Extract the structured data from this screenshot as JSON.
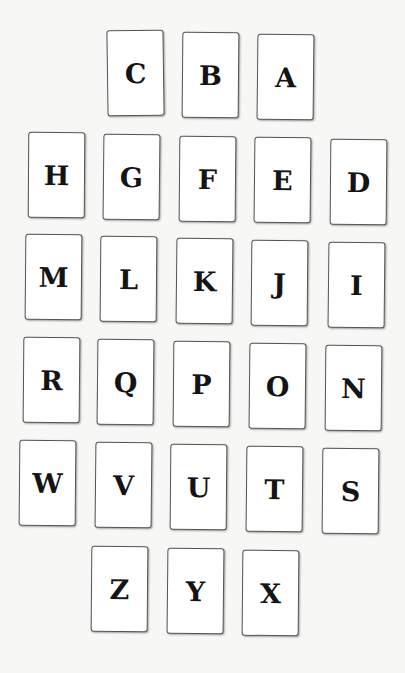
{
  "cards": [
    {
      "letter": "C",
      "x": 107,
      "y": 30,
      "rot": -0.8
    },
    {
      "letter": "B",
      "x": 182,
      "y": 32,
      "rot": 0.5
    },
    {
      "letter": "A",
      "x": 257,
      "y": 34,
      "rot": 0.6
    },
    {
      "letter": "H",
      "x": 28,
      "y": 132,
      "rot": 0.4
    },
    {
      "letter": "G",
      "x": 103,
      "y": 134,
      "rot": 0.6
    },
    {
      "letter": "F",
      "x": 179,
      "y": 136,
      "rot": 0.5
    },
    {
      "letter": "E",
      "x": 254,
      "y": 137,
      "rot": 0.6
    },
    {
      "letter": "D",
      "x": 330,
      "y": 139,
      "rot": 0.5
    },
    {
      "letter": "M",
      "x": 25,
      "y": 234,
      "rot": 0.5
    },
    {
      "letter": "L",
      "x": 100,
      "y": 236,
      "rot": 0.5
    },
    {
      "letter": "K",
      "x": 176,
      "y": 238,
      "rot": 0.6
    },
    {
      "letter": "J",
      "x": 251,
      "y": 240,
      "rot": 0.5
    },
    {
      "letter": "I",
      "x": 328,
      "y": 242,
      "rot": 0.6
    },
    {
      "letter": "R",
      "x": 23,
      "y": 337,
      "rot": 0.5
    },
    {
      "letter": "Q",
      "x": 97,
      "y": 339,
      "rot": 0.6
    },
    {
      "letter": "P",
      "x": 173,
      "y": 341,
      "rot": 0.5
    },
    {
      "letter": "O",
      "x": 249,
      "y": 343,
      "rot": 0.6
    },
    {
      "letter": "N",
      "x": 325,
      "y": 345,
      "rot": 0.5
    },
    {
      "letter": "W",
      "x": 19,
      "y": 440,
      "rot": 0.5
    },
    {
      "letter": "V",
      "x": 95,
      "y": 442,
      "rot": 0.6
    },
    {
      "letter": "U",
      "x": 170,
      "y": 444,
      "rot": 0.5
    },
    {
      "letter": "T",
      "x": 246,
      "y": 446,
      "rot": 0.6
    },
    {
      "letter": "S",
      "x": 322,
      "y": 448,
      "rot": 0.5
    },
    {
      "letter": "Z",
      "x": 91,
      "y": 546,
      "rot": 0.5
    },
    {
      "letter": "Y",
      "x": 167,
      "y": 548,
      "rot": 0.6
    },
    {
      "letter": "X",
      "x": 242,
      "y": 550,
      "rot": 0.5
    }
  ]
}
